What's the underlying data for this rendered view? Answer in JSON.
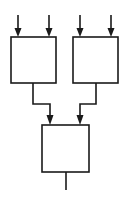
{
  "diagram": {
    "type": "tree-combiner",
    "stroke_color": "#1a1a1a",
    "background": "#ffffff",
    "nodes": [
      {
        "id": "block-left",
        "x": 11,
        "y": 37,
        "w": 45,
        "h": 46,
        "inputs": 2
      },
      {
        "id": "block-right",
        "x": 73,
        "y": 37,
        "w": 45,
        "h": 46,
        "inputs": 2
      },
      {
        "id": "block-bottom",
        "x": 42,
        "y": 125,
        "w": 47,
        "h": 47,
        "inputs": 2
      }
    ],
    "edges": [
      {
        "from": "external",
        "to": "block-left",
        "label": ""
      },
      {
        "from": "external",
        "to": "block-left",
        "label": ""
      },
      {
        "from": "external",
        "to": "block-right",
        "label": ""
      },
      {
        "from": "external",
        "to": "block-right",
        "label": ""
      },
      {
        "from": "block-left",
        "to": "block-bottom",
        "label": ""
      },
      {
        "from": "block-right",
        "to": "block-bottom",
        "label": ""
      },
      {
        "from": "block-bottom",
        "to": "external",
        "label": ""
      }
    ]
  }
}
